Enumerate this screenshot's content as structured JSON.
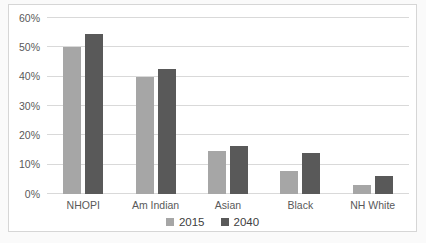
{
  "chart_data": {
    "type": "bar",
    "title": "",
    "xlabel": "",
    "ylabel": "",
    "categories": [
      "NHOPI",
      "Am Indian",
      "Asian",
      "Black",
      "NH White"
    ],
    "series": [
      {
        "name": "2015",
        "color": "#a6a6a6",
        "values": [
          50,
          40,
          14.5,
          8,
          3
        ]
      },
      {
        "name": "2040",
        "color": "#595959",
        "values": [
          54.5,
          42.5,
          16.5,
          14,
          6
        ]
      }
    ],
    "ylim": [
      0,
      60
    ],
    "yticks": [
      "0%",
      "10%",
      "20%",
      "30%",
      "40%",
      "50%",
      "60%"
    ],
    "ytick_format": "percent",
    "grid": true,
    "legend_position": "bottom"
  },
  "colors": {
    "page_background": "#fafafa",
    "chart_background": "#ffffff",
    "frame_border": "#d6d6d6",
    "gridline": "#d9d9d9",
    "axis_text": "#595959",
    "legend_text": "#404040"
  }
}
